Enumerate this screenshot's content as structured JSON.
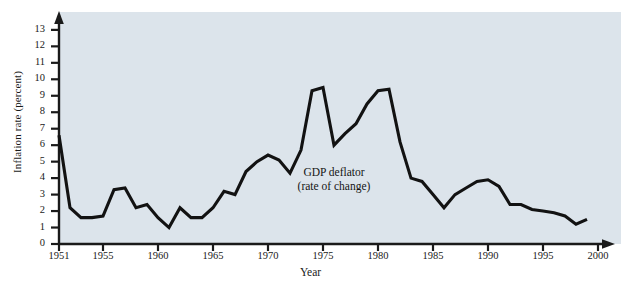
{
  "figure": {
    "background_color": "#ffffff",
    "plot_background_color": "#dce4eb",
    "line_color": "#121212",
    "axis_color": "#1a1a1a"
  },
  "annotation": {
    "line1": "GDP deflator",
    "line2": "(rate of change)"
  },
  "chart_data": {
    "type": "line",
    "title": "",
    "xlabel": "Year",
    "ylabel": "Inflation rate (percent)",
    "xlim": [
      1951,
      2000
    ],
    "ylim": [
      0,
      13.6
    ],
    "grid": false,
    "legend_position": "none",
    "annotations": [
      {
        "text": "GDP deflator (rate of change)",
        "x": 1976,
        "y": 4.4
      }
    ],
    "ytick_labels": [
      "0",
      "1",
      "2",
      "3",
      "4",
      "5",
      "6",
      "7",
      "8",
      "9",
      "10",
      "11",
      "12",
      "13"
    ],
    "ytick_values": [
      0,
      1,
      2,
      3,
      4,
      5,
      6,
      7,
      8,
      9,
      10,
      11,
      12,
      13
    ],
    "xtick_labels": [
      "1951",
      "1955",
      "1960",
      "1965",
      "1970",
      "1975",
      "1980",
      "1985",
      "1990",
      "1995",
      "2000"
    ],
    "xtick_values": [
      1951,
      1955,
      1960,
      1965,
      1970,
      1975,
      1980,
      1985,
      1990,
      1995,
      2000
    ],
    "series": [
      {
        "name": "GDP deflator (rate of change)",
        "x": [
          1951,
          1952,
          1953,
          1954,
          1955,
          1956,
          1957,
          1958,
          1959,
          1960,
          1961,
          1962,
          1963,
          1964,
          1965,
          1966,
          1967,
          1968,
          1969,
          1970,
          1971,
          1972,
          1973,
          1974,
          1975,
          1976,
          1977,
          1978,
          1979,
          1980,
          1981,
          1982,
          1983,
          1984,
          1985,
          1986,
          1987,
          1988,
          1989,
          1990,
          1991,
          1992,
          1993,
          1994,
          1995,
          1996,
          1997,
          1998,
          1999
        ],
        "values": [
          6.6,
          2.2,
          1.6,
          1.6,
          1.7,
          3.3,
          3.4,
          2.2,
          2.4,
          1.6,
          1.0,
          2.2,
          1.6,
          1.6,
          2.2,
          3.2,
          3.0,
          4.4,
          5.0,
          5.4,
          5.1,
          4.3,
          5.7,
          9.3,
          9.5,
          6.0,
          6.7,
          7.3,
          8.5,
          9.3,
          9.4,
          6.2,
          4.0,
          3.8,
          3.0,
          2.2,
          3.0,
          3.4,
          3.8,
          3.9,
          3.5,
          2.4,
          2.4,
          2.1,
          2.0,
          1.9,
          1.7,
          1.2,
          1.5
        ]
      }
    ]
  }
}
